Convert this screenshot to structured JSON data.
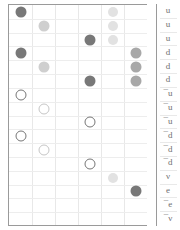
{
  "panel": {
    "title": "quark-content-matrix",
    "grid": {
      "columns": 6,
      "rows": 16,
      "col_x": [
        12,
        36,
        59,
        82,
        105,
        128
      ],
      "row_y": [
        9,
        22,
        35,
        48,
        61,
        74,
        87,
        100,
        113,
        126,
        139,
        152,
        165,
        178,
        191,
        204
      ],
      "gridlines_visible": true
    }
  },
  "labels": {
    "name": "particle-label-column",
    "items": [
      {
        "text": "u"
      },
      {
        "text": "u"
      },
      {
        "text": "u"
      },
      {
        "text": "d"
      },
      {
        "text": "d"
      },
      {
        "text": "d"
      },
      {
        "text": "¯u"
      },
      {
        "text": "¯u"
      },
      {
        "text": "¯u"
      },
      {
        "text": "¯d"
      },
      {
        "text": "¯d"
      },
      {
        "text": "¯d"
      },
      {
        "text": "ν"
      },
      {
        "text": "e"
      },
      {
        "text": "¯e"
      },
      {
        "text": "¯ν"
      }
    ]
  },
  "colors": {
    "dark_fill": "#787878",
    "mid_fill": "#a8a8a8",
    "light_fill": "#cfcfcf",
    "pale_fill": "#e2e2e2",
    "hollow_stroke_dark": "#767676",
    "hollow_stroke_light": "#c6c6c6",
    "grid_line": "#e8e8e8",
    "panel_border": "#9a9a9a",
    "label_text": "#6f6f6f",
    "background": "#ffffff"
  },
  "chart_data": {
    "type": "scatter",
    "title": "",
    "xlabel": "",
    "ylabel": "",
    "xlim": [
      0,
      6
    ],
    "ylim": [
      0,
      16
    ],
    "grid": true,
    "legend": null,
    "categories_y": [
      "u",
      "u",
      "u",
      "d",
      "d",
      "d",
      "¯u",
      "¯u",
      "¯u",
      "¯d",
      "¯d",
      "¯d",
      "ν",
      "e",
      "¯e",
      "¯ν"
    ],
    "points": [
      {
        "col": 1,
        "row": 1,
        "style": "filled",
        "shade": "dark_fill",
        "size": 11
      },
      {
        "col": 5,
        "row": 1,
        "style": "filled",
        "shade": "pale_fill",
        "size": 10
      },
      {
        "col": 2,
        "row": 2,
        "style": "filled",
        "shade": "light_fill",
        "size": 11
      },
      {
        "col": 5,
        "row": 2,
        "style": "filled",
        "shade": "pale_fill",
        "size": 10
      },
      {
        "col": 4,
        "row": 3,
        "style": "filled",
        "shade": "dark_fill",
        "size": 11
      },
      {
        "col": 5,
        "row": 3,
        "style": "filled",
        "shade": "pale_fill",
        "size": 10
      },
      {
        "col": 1,
        "row": 4,
        "style": "filled",
        "shade": "dark_fill",
        "size": 11
      },
      {
        "col": 6,
        "row": 4,
        "style": "filled",
        "shade": "mid_fill",
        "size": 11
      },
      {
        "col": 2,
        "row": 5,
        "style": "filled",
        "shade": "light_fill",
        "size": 11
      },
      {
        "col": 6,
        "row": 5,
        "style": "filled",
        "shade": "mid_fill",
        "size": 11
      },
      {
        "col": 4,
        "row": 6,
        "style": "filled",
        "shade": "dark_fill",
        "size": 11
      },
      {
        "col": 6,
        "row": 6,
        "style": "filled",
        "shade": "mid_fill",
        "size": 11
      },
      {
        "col": 1,
        "row": 7,
        "style": "hollow",
        "shade": "hollow_stroke_dark",
        "size": 11
      },
      {
        "col": 2,
        "row": 8,
        "style": "hollow",
        "shade": "hollow_stroke_light",
        "size": 11
      },
      {
        "col": 4,
        "row": 9,
        "style": "hollow",
        "shade": "hollow_stroke_dark",
        "size": 11
      },
      {
        "col": 1,
        "row": 10,
        "style": "hollow",
        "shade": "hollow_stroke_dark",
        "size": 11
      },
      {
        "col": 2,
        "row": 11,
        "style": "hollow",
        "shade": "hollow_stroke_light",
        "size": 11
      },
      {
        "col": 4,
        "row": 12,
        "style": "hollow",
        "shade": "hollow_stroke_dark",
        "size": 11
      },
      {
        "col": 5,
        "row": 13,
        "style": "filled",
        "shade": "pale_fill",
        "size": 10
      },
      {
        "col": 6,
        "row": 14,
        "style": "filled",
        "shade": "dark_fill",
        "size": 11
      }
    ]
  }
}
